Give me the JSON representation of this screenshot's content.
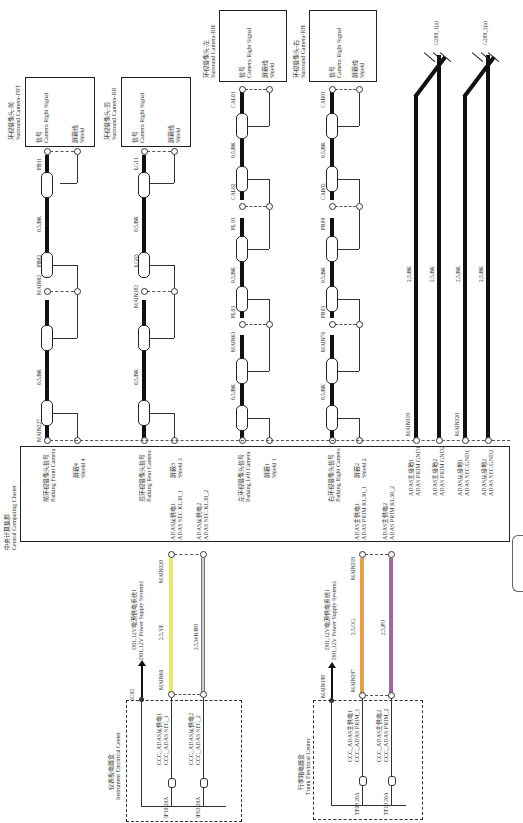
{
  "diagram": {
    "orientation": "rotated 90 degrees counter-clockwise",
    "central_unit": {
      "name_cn": "中央计算集群",
      "name_en": "Central Computing Cluster",
      "pins": [
        {
          "cn": "前环视摄像头信号",
          "en": "Parking Front Camera"
        },
        {
          "cn": "屏蔽4",
          "en": "Shield 4"
        },
        {
          "cn": "后环视摄像头信号",
          "en": "Parking Rear Camera"
        },
        {
          "cn": "屏蔽3",
          "en": "Shield 3"
        },
        {
          "cn": "ADAS从供电1",
          "en": "ADAS SEC KL30_1"
        },
        {
          "cn": "ADAS从供电2",
          "en": "ADAS SEC KL30_2"
        },
        {
          "cn": "左环视摄像头信号",
          "en": "Parking Left Camera"
        },
        {
          "cn": "屏蔽1",
          "en": "Shield 1"
        },
        {
          "cn": "右环视摄像头信号",
          "en": "Parking Right Camera"
        },
        {
          "cn": "屏蔽2",
          "en": "Shield 2"
        },
        {
          "cn": "ADAS主供电1",
          "en": "ADAS PRIM KL30_1"
        },
        {
          "cn": "ADAS主供电2",
          "en": "ADAS PRIM KL30_2"
        },
        {
          "cn": "ADAS主接地1",
          "en": "ADAS PRIM GND1"
        },
        {
          "cn": "ADAS主接地2",
          "en": "ADAS PRIM GND2"
        },
        {
          "cn": "ADAS从接地1",
          "en": "ADAS SEC GND1"
        },
        {
          "cn": "ADAS从接地2",
          "en": "ADAS SEC GND2"
        }
      ]
    },
    "cameras": [
      {
        "cn": "环视摄像头-前",
        "en": "Surround Camera-FRT",
        "signal_cn": "信号",
        "signal_en": "Camera Right Signal",
        "shield_cn": "屏蔽线",
        "shield_en": "Shield",
        "connectors": [
          "MAIN227",
          "MAIN02",
          "FB02",
          "FB11"
        ],
        "wire": [
          "0.5,BK",
          "0.5,BK"
        ]
      },
      {
        "cn": "环视摄像头-后",
        "en": "Surround Camera-RR",
        "signal_cn": "信号",
        "signal_en": "Camera Right Signal",
        "shield_cn": "屏蔽线",
        "shield_en": "Shield",
        "connectors": [
          "MAIN182",
          "LG03",
          "LG11"
        ],
        "wire": [
          "0.5,BK",
          "0.5,BK"
        ]
      },
      {
        "cn": "环视摄像头-左",
        "en": "Surround Camera-RH",
        "signal_cn": "信号",
        "signal_en": "Camera Right Signal",
        "shield_cn": "屏蔽线",
        "shield_en": "Shield",
        "connectors": [
          "MAIN63",
          "FL03",
          "FL10",
          "CAL02",
          "CAL01"
        ],
        "wire": [
          "0.5,BK",
          "0.5,BK",
          "0.5,BK"
        ]
      },
      {
        "cn": "环视摄像头-右",
        "en": "Surround Camera-RH",
        "signal_cn": "信号",
        "signal_en": "Camera Right Signal",
        "shield_cn": "屏蔽线",
        "shield_en": "Shield",
        "connectors": [
          "MAIN76",
          "FR03",
          "FR09",
          "CAR02",
          "CAR01"
        ],
        "wire": [
          "0.5,BK",
          "0.5,BK",
          "0.5,BK"
        ]
      }
    ],
    "grounds": [
      {
        "connector": "MAIN319",
        "wires": [
          "2.5,BK",
          "2.5,BK"
        ],
        "ground": "G209_1(a)"
      },
      {
        "connector": "MAIN320",
        "wires": [
          "2.5,BK",
          "2.5,BK"
        ],
        "ground": "G209_2(a)"
      }
    ],
    "power_centers": [
      {
        "cn": "仪表板电器盒",
        "en": "Instrument Electrical Center",
        "feed_conn": "IC02",
        "supply_cn": "D01,12V电源供电系统1",
        "supply_en": "D01,12V Power Supply System1",
        "fuses": [
          {
            "fuse": "IF10 20A",
            "cn": "CCC_ADAS从供电1",
            "en": "CCC_ADAS SEC_1",
            "from": "MAIN60",
            "to": "MAIN320",
            "wire": "2.5,YE",
            "color": "#e8e86a"
          },
          {
            "fuse": "IF63 20A",
            "cn": "CCC_ADAS从供电2",
            "en": "CCC_ADAS SEC_2",
            "wire": "2.5,WH/BU",
            "color": "#c8ccd8"
          }
        ]
      },
      {
        "cn": "行李箱电器盒",
        "en": "Trunk Electrical Center",
        "feed_conn": "MAIN198",
        "supply_cn": "D01,12V电源供电系统1",
        "supply_en": "D01,12V Power Supply System1",
        "fuses": [
          {
            "fuse": "TF08 20A",
            "cn": "CCC_ADAS主供电1",
            "en": "CCC_ADAS PRIM_1",
            "from": "MAIN297",
            "to": "MAIN319",
            "wire": "2.5,OG",
            "color": "#e0a050"
          },
          {
            "fuse": "TF10 20A",
            "cn": "CCC_ADAS主供电2",
            "en": "CCC_ADAS PRIM_2",
            "wire": "2.5,PU",
            "color": "#9a6a9e"
          }
        ]
      }
    ]
  }
}
